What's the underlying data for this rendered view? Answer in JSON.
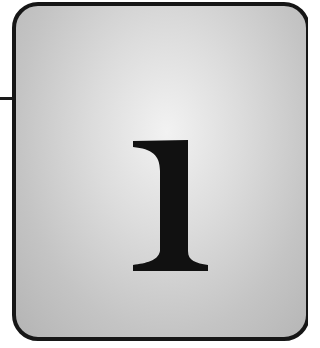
{
  "chapter": {
    "number": "1",
    "box_border_color": "#161616",
    "box_fill_light": "#f2f2f2",
    "box_fill_dark": "#b4b4b4",
    "numeral_color": "#111111"
  }
}
